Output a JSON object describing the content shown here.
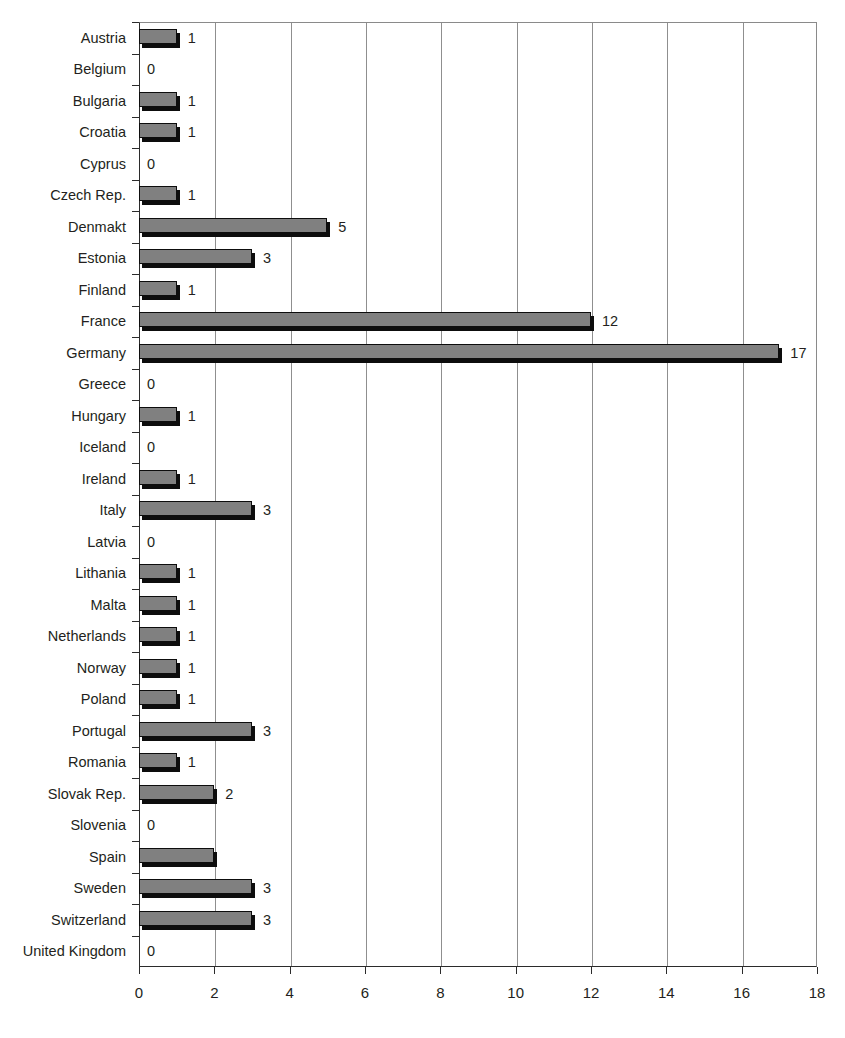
{
  "chart_data": {
    "type": "bar",
    "orientation": "horizontal",
    "title": "",
    "subtitle": "",
    "xlabel": "",
    "ylabel": "",
    "xlim": [
      0,
      18
    ],
    "xticks": [
      0,
      2,
      4,
      6,
      8,
      10,
      12,
      14,
      16,
      18
    ],
    "xtick_labels": [
      "0",
      "2",
      "4",
      "6",
      "8",
      "10",
      "12",
      "14",
      "16",
      "18"
    ],
    "grid": "vertical",
    "legend": "none",
    "bar_fill_color": "#808080",
    "bar_edge_color": "#0d0d0d",
    "categories": [
      "Austria",
      "Belgium",
      "Bulgaria",
      "Croatia",
      "Cyprus",
      "Czech Rep.",
      "Denmakt",
      "Estonia",
      "Finland",
      "France",
      "Germany",
      "Greece",
      "Hungary",
      "Iceland",
      "Ireland",
      "Italy",
      "Latvia",
      "Lithania",
      "Malta",
      "Netherlands",
      "Norway",
      "Poland",
      "Portugal",
      "Romania",
      "Slovak Rep.",
      "Slovenia",
      "Spain",
      "Sweden",
      "Switzerland",
      "United Kingdom"
    ],
    "values": [
      1,
      0,
      1,
      1,
      0,
      1,
      5,
      3,
      1,
      12,
      17,
      0,
      1,
      0,
      1,
      3,
      0,
      1,
      1,
      1,
      1,
      1,
      3,
      1,
      2,
      0,
      2,
      3,
      3,
      0
    ],
    "data_labels": [
      "1",
      "0",
      "1",
      "1",
      "0",
      "1",
      "5",
      "3",
      "1",
      "12",
      "17",
      "0",
      "1",
      "0",
      "1",
      "3",
      "0",
      "1",
      "1",
      "1",
      "1",
      "1",
      "3",
      "1",
      "2",
      "0",
      "",
      "3",
      "3",
      "0"
    ]
  }
}
